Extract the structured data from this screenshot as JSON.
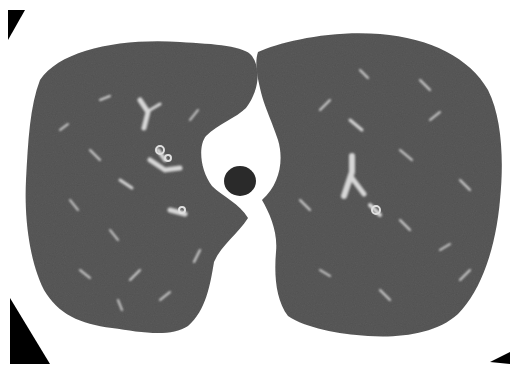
{
  "image": {
    "kind": "axial chest CT slice (lung window)",
    "width": 510,
    "height": 374,
    "background_color": "#ffffff",
    "lung_parenchyma_color": "#5a5a5a",
    "vessel_color": "#d8d8d8",
    "airway_color": "#2a2a2a",
    "corner_marker_color": "#000000",
    "regions": [
      {
        "name": "right-lung",
        "side": "image-left"
      },
      {
        "name": "left-lung",
        "side": "image-right"
      },
      {
        "name": "trachea",
        "position": "center"
      },
      {
        "name": "mediastinum",
        "position": "center"
      }
    ]
  }
}
